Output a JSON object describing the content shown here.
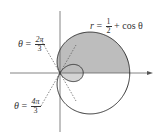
{
  "diagram": {
    "equation": {
      "lhs": "r",
      "eq": "=",
      "frac_num": "1",
      "frac_den": "2",
      "rest": "+ cos θ"
    },
    "angle_labels": [
      {
        "var": "θ",
        "eq": "=",
        "num": "2π",
        "den": "3"
      },
      {
        "var": "θ",
        "eq": "=",
        "num": "4π",
        "den": "3"
      }
    ],
    "colors": {
      "curve": "#333333",
      "axis": "#555555",
      "shade_outer": "#bdbdbd",
      "shade_inner": "#d4d4d4",
      "dashed": "#555555"
    }
  }
}
